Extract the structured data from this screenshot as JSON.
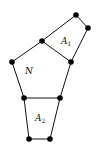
{
  "diagram": {
    "vertices": [
      {
        "id": "v1",
        "x": 76,
        "y": 15
      },
      {
        "id": "v2",
        "x": 88,
        "y": 28
      },
      {
        "id": "v3",
        "x": 42,
        "y": 41
      },
      {
        "id": "v4",
        "x": 71,
        "y": 62
      },
      {
        "id": "v5",
        "x": 12,
        "y": 62
      },
      {
        "id": "v6",
        "x": 24,
        "y": 98
      },
      {
        "id": "v7",
        "x": 60,
        "y": 98
      },
      {
        "id": "v8",
        "x": 29,
        "y": 139
      },
      {
        "id": "v9",
        "x": 50,
        "y": 139
      }
    ],
    "regions": {
      "A1": {
        "letter": "A",
        "subscript": "1"
      },
      "N": {
        "letter": "N"
      },
      "A2": {
        "letter": "A",
        "subscript": "2"
      }
    }
  }
}
